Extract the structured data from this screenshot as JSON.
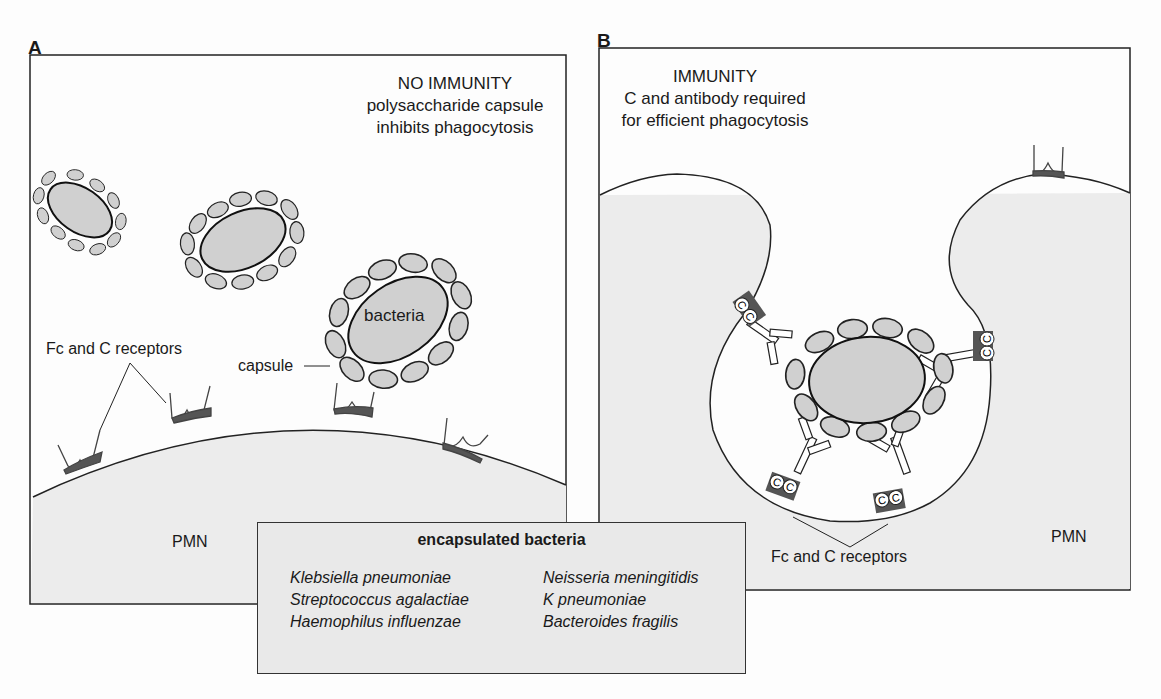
{
  "figure": {
    "panel_a": {
      "letter": "A",
      "title_line1": "NO IMMUNITY",
      "title_line2": "polysaccharide capsule",
      "title_line3": "inhibits phagocytosis",
      "label_bacteria": "bacteria",
      "label_capsule": "capsule",
      "label_receptors": "Fc and C receptors",
      "label_cell": "PMN"
    },
    "panel_b": {
      "letter": "B",
      "title_line1": "IMMUNITY",
      "title_line2": "C and antibody required",
      "title_line3": "for efficient phagocytosis",
      "label_receptors": "Fc and C receptors",
      "label_cell": "PMN",
      "complement_label": "C"
    },
    "legend": {
      "title": "encapsulated bacteria",
      "col1": [
        "Klebsiella pneumoniae",
        "Streptococcus agalactiae",
        "Haemophilus influenzae"
      ],
      "col2": [
        "Neisseria meningitidis",
        "K pneumoniae",
        "Bacteroides fragilis"
      ]
    },
    "colors": {
      "cell_fill": "#ececec",
      "bacteria_fill": "#cfcfcf",
      "receptor_fill": "#555555",
      "outline": "#1a1a1a"
    }
  }
}
